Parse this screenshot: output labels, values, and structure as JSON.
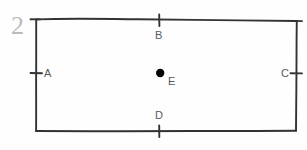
{
  "figure": {
    "number": "2",
    "number_color": "#b9babc",
    "stroke_color": "#333333",
    "label_color": "#58595b",
    "background_color": "#fefefe",
    "point_color": "#000000"
  },
  "labels": {
    "a": "A",
    "b": "B",
    "c": "C",
    "d": "D",
    "e": "E"
  },
  "geometry": {
    "rectangle": {
      "top_left": [
        36,
        19
      ],
      "top_right": [
        297,
        21
      ],
      "bottom_right": [
        296,
        131
      ],
      "bottom_left": [
        36,
        131
      ]
    },
    "tick_marks": [
      {
        "name": "tick-a-left-edge",
        "x": 36,
        "y": 73,
        "orientation": "horizontal"
      },
      {
        "name": "tick-b-top-edge",
        "x": 159,
        "y": 20,
        "orientation": "vertical"
      },
      {
        "name": "tick-c-right-edge",
        "x": 296,
        "y": 73,
        "orientation": "horizontal"
      },
      {
        "name": "tick-d-bottom-edge",
        "x": 159,
        "y": 131,
        "orientation": "vertical"
      },
      {
        "name": "tick-top-left-corner",
        "x": 36,
        "y": 19,
        "orientation": "horizontal"
      },
      {
        "name": "tick-top-right-corner",
        "x": 297,
        "y": 21,
        "orientation": "horizontal"
      }
    ],
    "center_point": {
      "name": "E",
      "x": 160,
      "y": 73,
      "radius": 4.2
    }
  }
}
